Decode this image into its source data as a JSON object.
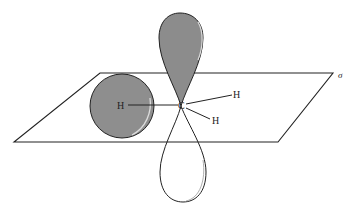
{
  "diagram": {
    "plane_label": "σ",
    "atoms": {
      "center": "C",
      "h_left": "H",
      "h_upper_right": "H",
      "h_lower_right": "H"
    },
    "colors": {
      "shaded_lobe": "#8c8c8c",
      "sphere": "#8e8e8e",
      "outline": "#222222",
      "plane": "#222222"
    }
  }
}
